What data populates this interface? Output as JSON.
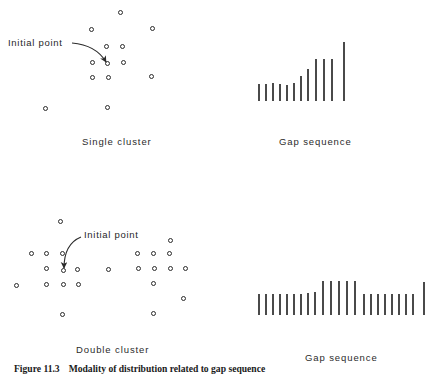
{
  "figure": {
    "caption_number": "Figure 11.3",
    "caption_text": "Modality of distribution related to gap sequence",
    "annotation_label_top": "Initial point",
    "annotation_label_bottom": "Initial point"
  },
  "panels": {
    "top_left": {
      "caption": "Single cluster",
      "caption_x": 82,
      "caption_y": 136,
      "origin_x": 0,
      "origin_y": 0,
      "label_x": 8,
      "label_y": 37,
      "arrow": {
        "x1": 72,
        "y1": 43,
        "cx": 96,
        "cy": 45,
        "x2": 106,
        "y2": 62
      },
      "points": [
        {
          "x": 118,
          "y": 10
        },
        {
          "x": 89,
          "y": 27
        },
        {
          "x": 150,
          "y": 26
        },
        {
          "x": 104,
          "y": 44
        },
        {
          "x": 120,
          "y": 44
        },
        {
          "x": 90,
          "y": 60
        },
        {
          "x": 105,
          "y": 61
        },
        {
          "x": 121,
          "y": 60
        },
        {
          "x": 90,
          "y": 75
        },
        {
          "x": 106,
          "y": 75
        },
        {
          "x": 149,
          "y": 74
        },
        {
          "x": 43,
          "y": 106
        },
        {
          "x": 105,
          "y": 105
        }
      ]
    },
    "top_right": {
      "caption": "Gap sequence",
      "caption_x": 279,
      "caption_y": 136,
      "origin_x": 0,
      "origin_y": 0,
      "baseline_y": 101,
      "bars": [
        {
          "x": 258,
          "h": 17
        },
        {
          "x": 265,
          "h": 17
        },
        {
          "x": 272,
          "h": 18
        },
        {
          "x": 279,
          "h": 17
        },
        {
          "x": 286,
          "h": 16
        },
        {
          "x": 293,
          "h": 18
        },
        {
          "x": 300,
          "h": 25
        },
        {
          "x": 307,
          "h": 32
        },
        {
          "x": 315,
          "h": 42
        },
        {
          "x": 323,
          "h": 42
        },
        {
          "x": 331,
          "h": 42
        },
        {
          "x": 343,
          "h": 59
        }
      ]
    },
    "bottom_left": {
      "caption": "Double cluster",
      "caption_x": 76,
      "caption_y": 344,
      "origin_x": 0,
      "origin_y": 0,
      "label_x": 84,
      "label_y": 229,
      "arrow": {
        "x1": 81,
        "y1": 237,
        "cx": 64,
        "cy": 244,
        "x2": 64,
        "y2": 268
      },
      "points": [
        {
          "x": 58,
          "y": 219
        },
        {
          "x": 168,
          "y": 238
        },
        {
          "x": 29,
          "y": 251
        },
        {
          "x": 44,
          "y": 251
        },
        {
          "x": 60,
          "y": 251
        },
        {
          "x": 135,
          "y": 251
        },
        {
          "x": 151,
          "y": 251
        },
        {
          "x": 167,
          "y": 251
        },
        {
          "x": 44,
          "y": 266
        },
        {
          "x": 61,
          "y": 268
        },
        {
          "x": 75,
          "y": 267
        },
        {
          "x": 106,
          "y": 267
        },
        {
          "x": 136,
          "y": 266
        },
        {
          "x": 152,
          "y": 266
        },
        {
          "x": 168,
          "y": 266
        },
        {
          "x": 183,
          "y": 266
        },
        {
          "x": 14,
          "y": 283
        },
        {
          "x": 44,
          "y": 282
        },
        {
          "x": 61,
          "y": 282
        },
        {
          "x": 76,
          "y": 282
        },
        {
          "x": 151,
          "y": 281
        },
        {
          "x": 181,
          "y": 296
        },
        {
          "x": 60,
          "y": 312
        },
        {
          "x": 151,
          "y": 311
        }
      ]
    },
    "bottom_right": {
      "caption": "Gap sequence",
      "caption_x": 305,
      "caption_y": 352,
      "origin_x": 0,
      "origin_y": 0,
      "baseline_y": 315,
      "bars": [
        {
          "x": 258,
          "h": 21
        },
        {
          "x": 265,
          "h": 21
        },
        {
          "x": 272,
          "h": 21
        },
        {
          "x": 279,
          "h": 21
        },
        {
          "x": 286,
          "h": 21
        },
        {
          "x": 293,
          "h": 21
        },
        {
          "x": 300,
          "h": 21
        },
        {
          "x": 307,
          "h": 22
        },
        {
          "x": 314,
          "h": 23
        },
        {
          "x": 322,
          "h": 34
        },
        {
          "x": 330,
          "h": 34
        },
        {
          "x": 338,
          "h": 34
        },
        {
          "x": 346,
          "h": 34
        },
        {
          "x": 354,
          "h": 34
        },
        {
          "x": 363,
          "h": 21
        },
        {
          "x": 370,
          "h": 21
        },
        {
          "x": 377,
          "h": 21
        },
        {
          "x": 384,
          "h": 21
        },
        {
          "x": 391,
          "h": 21
        },
        {
          "x": 398,
          "h": 21
        },
        {
          "x": 405,
          "h": 21
        },
        {
          "x": 412,
          "h": 21
        },
        {
          "x": 423,
          "h": 33
        }
      ]
    }
  },
  "chart_data": [
    {
      "type": "bar",
      "title": "Gap sequence",
      "panel": "top_right",
      "description": "Monotonically increasing gap sequence for a single cluster",
      "categories": [
        "1",
        "2",
        "3",
        "4",
        "5",
        "6",
        "7",
        "8",
        "9",
        "10",
        "11",
        "12"
      ],
      "values": [
        17,
        17,
        18,
        17,
        16,
        18,
        25,
        32,
        42,
        42,
        42,
        59
      ],
      "xlabel": "",
      "ylabel": "Gap",
      "ylim": [
        0,
        62
      ],
      "grid": false,
      "legend": "none"
    },
    {
      "type": "bar",
      "title": "Gap sequence",
      "panel": "bottom_right",
      "description": "Gap sequence with elevated middle plateau indicating two clusters",
      "categories": [
        "1",
        "2",
        "3",
        "4",
        "5",
        "6",
        "7",
        "8",
        "9",
        "10",
        "11",
        "12",
        "13",
        "14",
        "15",
        "16",
        "17",
        "18",
        "19",
        "20",
        "21",
        "22",
        "23"
      ],
      "values": [
        21,
        21,
        21,
        21,
        21,
        21,
        21,
        22,
        23,
        34,
        34,
        34,
        34,
        34,
        21,
        21,
        21,
        21,
        21,
        21,
        21,
        21,
        33
      ],
      "xlabel": "",
      "ylabel": "Gap",
      "ylim": [
        0,
        36
      ],
      "grid": false,
      "legend": "none"
    },
    {
      "type": "scatter",
      "title": "Single cluster",
      "panel": "top_left",
      "description": "Point distribution forming one cluster with a marked initial point",
      "x": [
        118,
        89,
        150,
        104,
        120,
        90,
        105,
        121,
        90,
        106,
        149,
        43,
        105
      ],
      "y": [
        10,
        27,
        26,
        44,
        44,
        60,
        61,
        60,
        75,
        75,
        74,
        106,
        105
      ],
      "annotations": [
        "Initial point"
      ],
      "xlabel": "",
      "ylabel": "",
      "grid": false,
      "legend": "none"
    },
    {
      "type": "scatter",
      "title": "Double cluster",
      "panel": "bottom_left",
      "description": "Point distribution forming two clusters with a marked initial point",
      "x": [
        58,
        168,
        29,
        44,
        60,
        135,
        151,
        167,
        44,
        61,
        75,
        106,
        136,
        152,
        168,
        183,
        14,
        44,
        61,
        76,
        151,
        181,
        60,
        151
      ],
      "y": [
        219,
        238,
        251,
        251,
        251,
        251,
        251,
        251,
        266,
        268,
        267,
        267,
        266,
        266,
        266,
        266,
        283,
        282,
        282,
        282,
        281,
        296,
        312,
        311
      ],
      "annotations": [
        "Initial point"
      ],
      "xlabel": "",
      "ylabel": "",
      "grid": false,
      "legend": "none"
    }
  ]
}
